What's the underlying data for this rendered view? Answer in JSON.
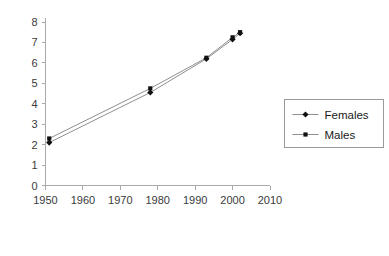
{
  "chart_data": {
    "type": "line",
    "title": "",
    "xlabel": "",
    "ylabel": "",
    "xlim": [
      1950,
      2010
    ],
    "ylim": [
      0,
      8
    ],
    "grid": false,
    "legend_position": "right",
    "x_ticks": [
      "1950",
      "1960",
      "1970",
      "1980",
      "1990",
      "2000",
      "2010"
    ],
    "x_tick_values": [
      1950,
      1960,
      1970,
      1980,
      1990,
      2000,
      2010
    ],
    "y_ticks": [
      "0",
      "1",
      "2",
      "3",
      "4",
      "5",
      "6",
      "7",
      "8"
    ],
    "y_tick_values": [
      0,
      1,
      2,
      3,
      4,
      5,
      6,
      7,
      8
    ],
    "series": [
      {
        "name": "Females",
        "marker": "diamond",
        "color": "#111111",
        "x": [
          1951,
          1978,
          1993,
          2000,
          2002
        ],
        "values": [
          2.1,
          4.55,
          6.2,
          7.15,
          7.45
        ]
      },
      {
        "name": "Males",
        "marker": "square",
        "color": "#111111",
        "x": [
          1951,
          1978,
          1993,
          2000,
          2002
        ],
        "values": [
          2.3,
          4.75,
          6.25,
          7.25,
          7.5
        ]
      }
    ]
  },
  "legend": {
    "entries": [
      {
        "label": "Females",
        "marker": "diamond"
      },
      {
        "label": "Males",
        "marker": "square"
      }
    ]
  }
}
